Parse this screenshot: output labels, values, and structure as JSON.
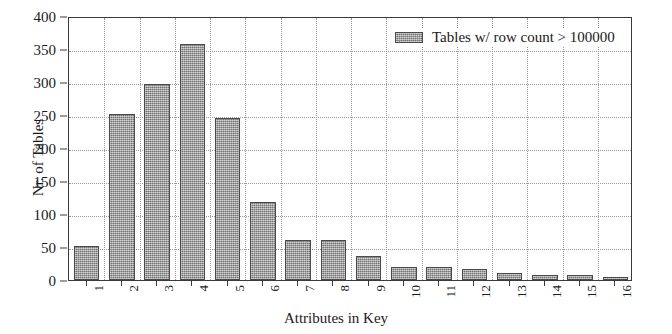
{
  "chart_data": {
    "type": "bar",
    "title": "",
    "xlabel": "Attributes in Key",
    "ylabel": "Nr. of Tables",
    "categories": [
      "1",
      "2",
      "3",
      "4",
      "5",
      "6",
      "7",
      "8",
      "9",
      "10",
      "11",
      "12",
      "13",
      "14",
      "15",
      "16"
    ],
    "values": [
      52,
      252,
      297,
      358,
      245,
      118,
      60,
      60,
      37,
      20,
      19,
      17,
      10,
      7,
      7,
      5
    ],
    "series": [
      {
        "name": "Tables w/ row count > 100000",
        "values": [
          52,
          252,
          297,
          358,
          245,
          118,
          60,
          60,
          37,
          20,
          19,
          17,
          10,
          7,
          7,
          5
        ]
      }
    ],
    "ylim": [
      0,
      400
    ],
    "yticks": [
      0,
      50,
      100,
      150,
      200,
      250,
      300,
      350,
      400
    ],
    "ytick_labels": [
      "0",
      "50",
      "100",
      "150",
      "200",
      "250",
      "300",
      "350",
      "400"
    ],
    "grid": true,
    "grid_style": "dotted",
    "legend": {
      "position": "upper-right",
      "entries": [
        "Tables w/ row count > 100000"
      ]
    },
    "bar_color": "#a3a3a3",
    "bar_edge_color": "#4a4a4a",
    "axis_color": "#3a3a3a",
    "grid_color": "#9a9a9a",
    "background": "#ffffff"
  }
}
